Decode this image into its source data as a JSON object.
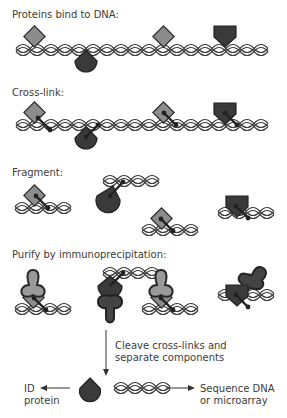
{
  "steps": [
    {
      "label": "Proteins bind to DNA:"
    },
    {
      "label": "Cross-link:"
    },
    {
      "label": "Fragment:"
    },
    {
      "label": "Purify by immunoprecipitation:"
    }
  ],
  "cleave_step": {
    "line1": "Cleave cross-links and",
    "line2": "separate components"
  },
  "outputs": {
    "protein_line1": "ID",
    "protein_line2": "protein",
    "dna_line1": "Sequence DNA",
    "dna_line2": "or microarray"
  },
  "colors": {
    "light_protein": "#8c8c8c",
    "dark_protein": "#3a3a3a",
    "outline": "#222222",
    "dna_strand": "#444444",
    "antibody_light": "#9a9a9a",
    "antibody_dark": "#444444"
  }
}
